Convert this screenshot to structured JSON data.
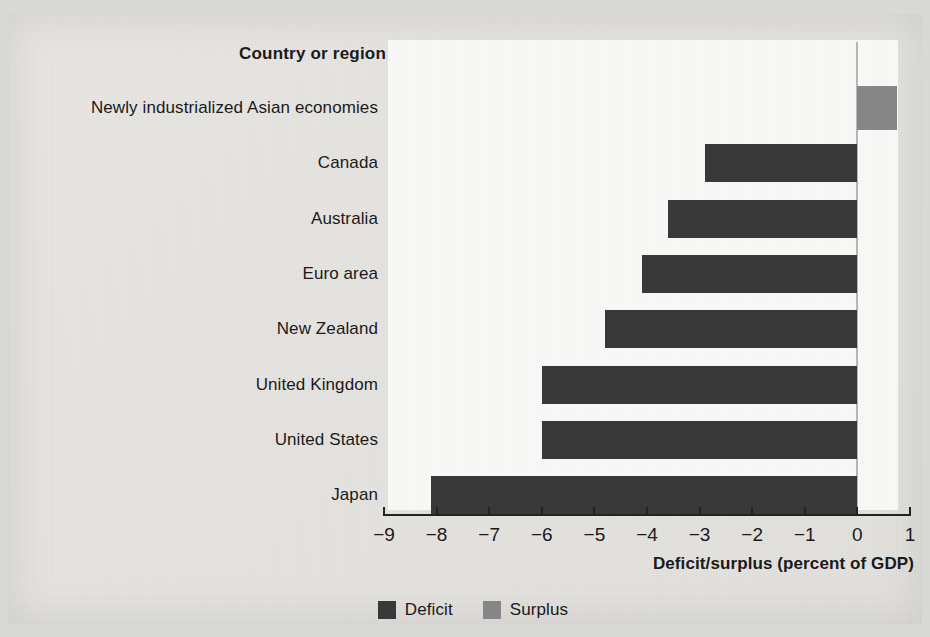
{
  "chart_data": {
    "type": "bar",
    "orientation": "horizontal",
    "title": "",
    "category_header": "Country or region",
    "xlabel": "Deficit/surplus (percent of GDP)",
    "ylabel": "",
    "xlim": [
      -9,
      1
    ],
    "xticks": [
      -9,
      -8,
      -7,
      -6,
      -5,
      -4,
      -3,
      -2,
      -1,
      0,
      1
    ],
    "xtick_labels": [
      "−9",
      "−8",
      "−7",
      "−6",
      "−5",
      "−4",
      "−3",
      "−2",
      "−1",
      "0",
      "1"
    ],
    "grid": false,
    "legend_position": "bottom-center",
    "categories": [
      "Newly industrialized Asian economies",
      "Canada",
      "Australia",
      "Euro area",
      "New Zealand",
      "United Kingdom",
      "United States",
      "Japan"
    ],
    "values": [
      0.75,
      -2.9,
      -3.6,
      -4.1,
      -4.8,
      -6.0,
      -6.0,
      -8.1
    ],
    "series": [
      {
        "name": "Deficit",
        "color": "#3a3a3a",
        "values": [
          null,
          -2.9,
          -3.6,
          -4.1,
          -4.8,
          -6.0,
          -6.0,
          -8.1
        ]
      },
      {
        "name": "Surplus",
        "color": "#8a8a8a",
        "values": [
          0.75,
          null,
          null,
          null,
          null,
          null,
          null,
          null
        ]
      }
    ],
    "legend": [
      {
        "label": "Deficit",
        "color": "#3a3a3a"
      },
      {
        "label": "Surplus",
        "color": "#8a8a8a"
      }
    ]
  },
  "colors": {
    "deficit": "#3a3a3a",
    "surplus": "#8a8a8a",
    "axis": "#242424",
    "zero_line": "#b9b9b7",
    "text": "#1b1b1b",
    "page_background": "#e9e7e4",
    "plot_background": "#fdfdfc"
  }
}
